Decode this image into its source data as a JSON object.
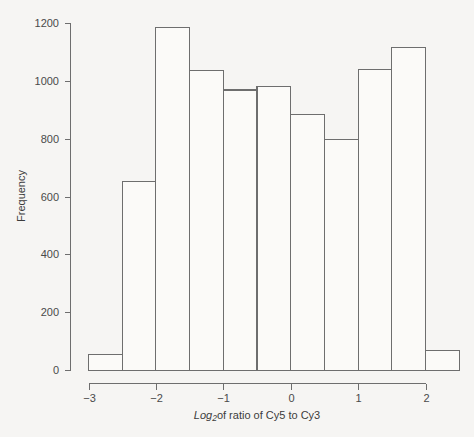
{
  "chart_data": {
    "type": "bar",
    "chart_subtype": "histogram",
    "title": "",
    "subtitle": "",
    "xlabel": "Log2of ratio of Cy5 to Cy3",
    "xlabel_parts": {
      "italic_prefix": "Log",
      "subscript": "2",
      "rest": "of ratio of Cy5 to Cy3"
    },
    "ylabel": "Frequency",
    "xlim": [
      -3.22,
      2.72
    ],
    "ylim": [
      0,
      1200
    ],
    "grid": false,
    "legend": null,
    "bin_width": 0.5,
    "bin_edges": [
      -3.0,
      -2.5,
      -2.0,
      -1.5,
      -1.0,
      -0.5,
      0.0,
      0.5,
      1.0,
      1.5,
      2.0,
      2.5
    ],
    "categories": [
      "-3.0 to -2.5",
      "-2.5 to -2.0",
      "-2.0 to -1.5",
      "-1.5 to -1.0",
      "-1.0 to -0.5",
      "-0.5 to 0.0",
      "0.0 to 0.5",
      "0.5 to 1.0",
      "1.0 to 1.5",
      "1.5 to 2.0",
      "2.0 to 2.5"
    ],
    "values": [
      55,
      655,
      1185,
      1037,
      970,
      982,
      885,
      800,
      1042,
      1117,
      70
    ],
    "xticks": [
      -3,
      -2,
      -1,
      0,
      1,
      2
    ],
    "xticklabels": [
      "-3",
      "-2",
      "-1",
      "0",
      "1",
      "2"
    ],
    "yticks": [
      0,
      200,
      400,
      600,
      800,
      1000,
      1200
    ],
    "yticklabels": [
      "0",
      "200",
      "400",
      "600",
      "800",
      "1000",
      "1200"
    ],
    "colors": {
      "background": "#f6f5f3",
      "bar_fill": "#fbfaf8",
      "bar_stroke": "#6e6e6e",
      "axis": "#6e6e6e",
      "text": "#4a4a4a"
    }
  }
}
